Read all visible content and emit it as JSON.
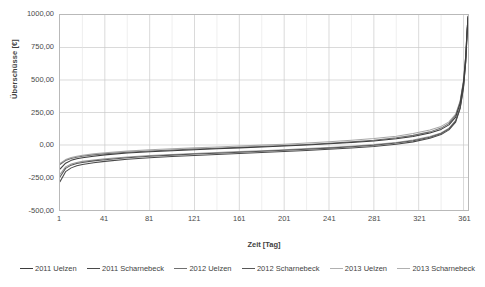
{
  "chart_data": {
    "type": "line",
    "title": "",
    "xlabel": "Zeit [Tag]",
    "ylabel": "Überschüsse [€]",
    "xlim": [
      1,
      365
    ],
    "ylim": [
      -500,
      1000
    ],
    "grid": true,
    "legend_position": "bottom",
    "y_ticks": [
      "1000,00",
      "750,00",
      "500,00",
      "250,00",
      "0,00",
      "-250,00",
      "-500,00"
    ],
    "y_tick_values": [
      1000,
      750,
      500,
      250,
      0,
      -250,
      -500
    ],
    "x_ticks": [
      "1",
      "41",
      "81",
      "121",
      "161",
      "201",
      "241",
      "281",
      "321",
      "361"
    ],
    "x_tick_values": [
      1,
      41,
      81,
      121,
      161,
      201,
      241,
      281,
      321,
      361
    ],
    "x": [
      1,
      6,
      11,
      16,
      21,
      31,
      41,
      61,
      81,
      101,
      121,
      141,
      161,
      181,
      201,
      221,
      241,
      261,
      281,
      301,
      316,
      331,
      341,
      348,
      354,
      358,
      361,
      363,
      364,
      365
    ],
    "series": [
      {
        "name": "2011 Uelzen",
        "color": "#3d3d3d",
        "values": [
          -185,
          -140,
          -118,
          -106,
          -98,
          -86,
          -76,
          -62,
          -52,
          -44,
          -36,
          -29,
          -22,
          -15,
          -8,
          0,
          9,
          19,
          31,
          48,
          66,
          92,
          120,
          155,
          215,
          320,
          480,
          680,
          850,
          990
        ]
      },
      {
        "name": "2011 Scharnebeck",
        "color": "#4a4a4a",
        "values": [
          -282,
          -205,
          -176,
          -160,
          -150,
          -136,
          -126,
          -110,
          -98,
          -89,
          -81,
          -73,
          -66,
          -58,
          -50,
          -42,
          -33,
          -23,
          -11,
          6,
          24,
          52,
          80,
          116,
          176,
          280,
          440,
          640,
          820,
          975
        ]
      },
      {
        "name": "2012 Uelzen",
        "color": "#707070",
        "values": [
          -150,
          -120,
          -104,
          -94,
          -87,
          -76,
          -68,
          -56,
          -46,
          -38,
          -31,
          -25,
          -18,
          -11,
          -4,
          4,
          13,
          24,
          37,
          55,
          74,
          101,
          130,
          166,
          228,
          332,
          492,
          688,
          855,
          985
        ]
      },
      {
        "name": "2012 Scharnebeck",
        "color": "#575757",
        "values": [
          -245,
          -180,
          -155,
          -142,
          -134,
          -122,
          -113,
          -98,
          -87,
          -78,
          -70,
          -63,
          -56,
          -48,
          -41,
          -33,
          -24,
          -14,
          -2,
          15,
          33,
          60,
          88,
          124,
          184,
          288,
          448,
          646,
          824,
          978
        ]
      },
      {
        "name": "2013 Uelzen",
        "color": "#a8a8a8",
        "values": [
          -142,
          -112,
          -96,
          -86,
          -79,
          -68,
          -60,
          -47,
          -37,
          -29,
          -22,
          -15,
          -8,
          -1,
          6,
          15,
          25,
          36,
          50,
          68,
          88,
          115,
          143,
          178,
          238,
          340,
          496,
          690,
          858,
          992
        ]
      },
      {
        "name": "2013 Scharnebeck",
        "color": "#9a9a9a",
        "values": [
          -225,
          -168,
          -146,
          -134,
          -126,
          -115,
          -106,
          -92,
          -81,
          -73,
          -65,
          -58,
          -51,
          -44,
          -36,
          -28,
          -19,
          -9,
          3,
          20,
          38,
          65,
          93,
          129,
          189,
          294,
          454,
          652,
          828,
          980
        ]
      }
    ]
  },
  "legend": {
    "items": [
      {
        "label": "2011 Uelzen",
        "color": "#3d3d3d"
      },
      {
        "label": "2011 Scharnebeck",
        "color": "#4a4a4a"
      },
      {
        "label": "2012 Uelzen",
        "color": "#707070"
      },
      {
        "label": "2012 Scharnebeck",
        "color": "#575757"
      },
      {
        "label": "2013 Uelzen",
        "color": "#b0b0b0"
      },
      {
        "label": "2013 Scharnebeck",
        "color": "#b0b0b0"
      }
    ]
  },
  "axes": {
    "y_title": "Überschüsse [€]",
    "x_title": "Zeit [Tag]"
  }
}
